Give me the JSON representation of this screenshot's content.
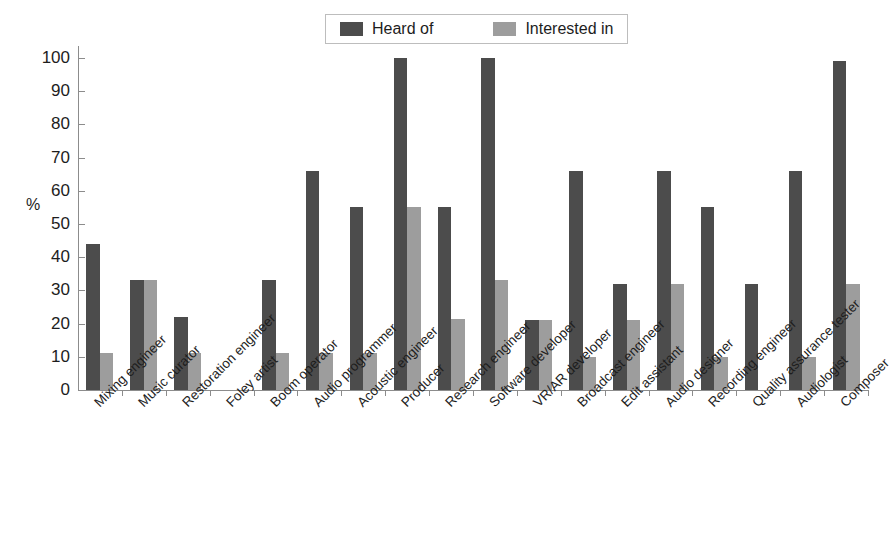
{
  "chart_data": {
    "type": "bar",
    "title": "",
    "subtitle": "",
    "xlabel": "",
    "ylabel": "%",
    "ylim": [
      0,
      100
    ],
    "yticks": [
      0,
      10,
      20,
      30,
      40,
      50,
      60,
      70,
      80,
      90,
      100
    ],
    "ytick_labels": [
      "0",
      "10",
      "20",
      "30",
      "40",
      "50",
      "60",
      "70",
      "80",
      "90",
      "100"
    ],
    "grid": false,
    "legend_position": "top-center",
    "orientation": "vertical",
    "categories": [
      "Mixing engineer",
      "Music curator",
      "Restoration engineer",
      "Foley artist",
      "Boom operator",
      "Audio programmer",
      "Acoustic engineer",
      "Producer",
      "Research engineer",
      "Software developer",
      "VR/AR developer",
      "Broadcast engineer",
      "Edit assistant",
      "Audio designer",
      "Recording engineer",
      "Quality assurance tester",
      "Audiologist",
      "Composer"
    ],
    "series": [
      {
        "name": "Heard of",
        "color": "#4c4c4c",
        "values": [
          44,
          33,
          22,
          0,
          33,
          66,
          55,
          100,
          55,
          100,
          21,
          66,
          32,
          66,
          55,
          32,
          66,
          99
        ]
      },
      {
        "name": "Interested in",
        "color": "#9d9d9d",
        "values": [
          11,
          33,
          11,
          0,
          11,
          11,
          11,
          55,
          21.5,
          33,
          21,
          10,
          21,
          32,
          10,
          0,
          10,
          32
        ]
      }
    ]
  },
  "legend": {
    "items": [
      {
        "label": "Heard of",
        "color": "#4c4c4c"
      },
      {
        "label": "Interested in",
        "color": "#9d9d9d"
      }
    ]
  },
  "axis": {
    "y_title": "%"
  }
}
